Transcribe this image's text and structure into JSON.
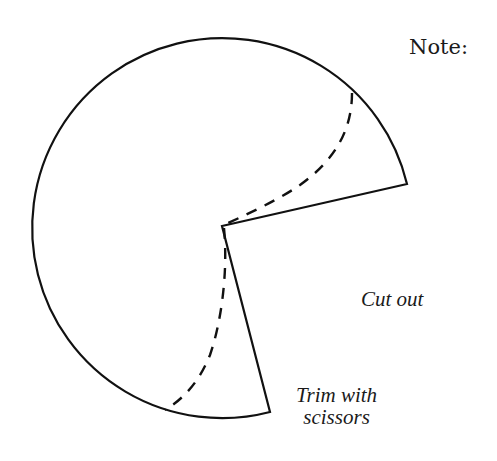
{
  "diagram": {
    "shape": "circle-with-wedge-removed",
    "line_color": "#111111",
    "background": "#ffffff"
  },
  "labels": {
    "note": "Note:",
    "cut_out": "Cut out",
    "trim_line1": "Trim with",
    "trim_line2": "scissors"
  },
  "legend": {
    "solid_line": "cut outline",
    "dashed_line": "trim guide"
  }
}
